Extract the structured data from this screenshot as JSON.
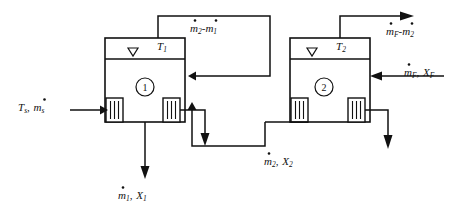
{
  "diagram": {
    "type": "process-flow-diagram",
    "background_color": "#ffffff",
    "line_color": "#111111",
    "effects": [
      {
        "id": "effect-1",
        "number": "1",
        "temperature_label": "T",
        "temperature_subscript": "1"
      },
      {
        "id": "effect-2",
        "number": "2",
        "temperature_label": "T",
        "temperature_subscript": "2"
      }
    ],
    "streams": [
      {
        "id": "steam-inlet",
        "role": "heating-steam-to-effect-1",
        "parts": [
          {
            "text": "T",
            "style": "italic"
          },
          {
            "text": "s",
            "style": "subscript"
          },
          {
            "text": ", ",
            "style": "plain"
          },
          {
            "text": "m",
            "style": "italic-dot"
          },
          {
            "text": "s",
            "style": "subscript"
          }
        ],
        "plain": "T_s, m_s"
      },
      {
        "id": "vapor-effect1-to-effect2",
        "role": "vapor-from-effect-1-to-effect-2",
        "parts": [
          {
            "text": "m",
            "style": "italic-dot"
          },
          {
            "text": "2",
            "style": "subscript"
          },
          {
            "text": "-",
            "style": "plain"
          },
          {
            "text": "m",
            "style": "italic-dot"
          },
          {
            "text": "1",
            "style": "subscript"
          }
        ],
        "plain": "m_2 - m_1"
      },
      {
        "id": "vapor-effect2-outlet",
        "role": "vapor-leaving-effect-2",
        "parts": [
          {
            "text": "m",
            "style": "italic-dot"
          },
          {
            "text": "F",
            "style": "subscript"
          },
          {
            "text": "-",
            "style": "plain"
          },
          {
            "text": "m",
            "style": "italic-dot"
          },
          {
            "text": "2",
            "style": "subscript"
          }
        ],
        "plain": "m_F - m_2"
      },
      {
        "id": "feed-inlet",
        "role": "feed-to-effect-2",
        "parts": [
          {
            "text": "m",
            "style": "italic-dot"
          },
          {
            "text": "F",
            "style": "subscript"
          },
          {
            "text": ", ",
            "style": "plain"
          },
          {
            "text": "X",
            "style": "italic"
          },
          {
            "text": "F",
            "style": "subscript"
          }
        ],
        "plain": "m_F, X_F"
      },
      {
        "id": "product-effect1",
        "role": "product-leaving-effect-1",
        "parts": [
          {
            "text": "m",
            "style": "italic-dot"
          },
          {
            "text": "1",
            "style": "subscript"
          },
          {
            "text": ", ",
            "style": "plain"
          },
          {
            "text": "X",
            "style": "italic"
          },
          {
            "text": "1",
            "style": "subscript"
          }
        ],
        "plain": "m_1, X_1"
      },
      {
        "id": "liquor-effect2-to-effect1",
        "role": "liquor-from-effect-2-to-effect-1",
        "parts": [
          {
            "text": "m",
            "style": "italic-dot"
          },
          {
            "text": "2",
            "style": "subscript"
          },
          {
            "text": ", ",
            "style": "plain"
          },
          {
            "text": "X",
            "style": "italic"
          },
          {
            "text": "2",
            "style": "subscript"
          }
        ],
        "plain": "m_2, X_2"
      }
    ]
  }
}
